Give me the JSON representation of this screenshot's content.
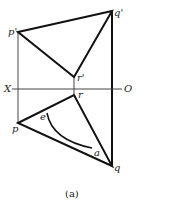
{
  "diagram": {
    "caption": "(a)",
    "labels": {
      "p_prime": "p'",
      "q_prime": "q'",
      "r_prime": "r'",
      "x": "X",
      "o": "O",
      "r": "r",
      "p": "p",
      "q": "q",
      "e": "e",
      "a": "a"
    },
    "colors": {
      "line": "#111111",
      "thin": "#444444"
    }
  }
}
